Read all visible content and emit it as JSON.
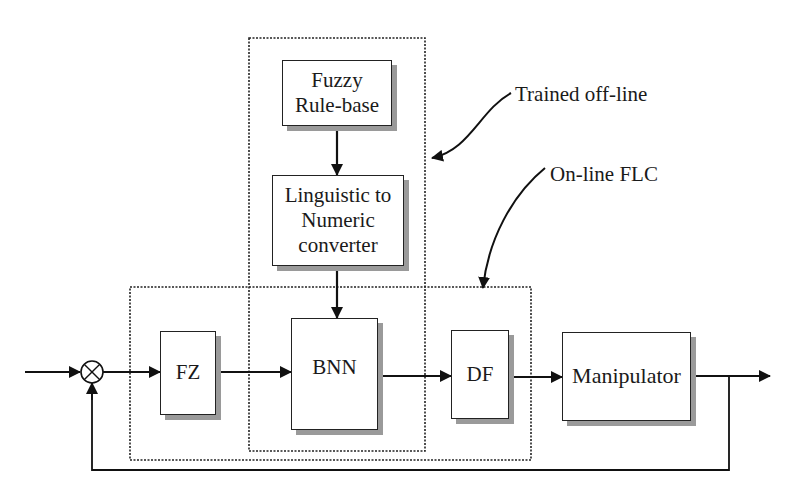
{
  "diagram": {
    "type": "block-diagram",
    "title": "",
    "blocks": {
      "fuzzy_rule_base": {
        "line1": "Fuzzy",
        "line2": "Rule-base"
      },
      "linguistic_converter": {
        "line1": "Linguistic to",
        "line2": "Numeric",
        "line3": "converter"
      },
      "fz": {
        "label": "FZ"
      },
      "bnn": {
        "label": "BNN"
      },
      "df": {
        "label": "DF"
      },
      "manipulator": {
        "label": "Manipulator"
      }
    },
    "summing_junction": {
      "symbol": "multiply-cross-circle"
    },
    "annotations": {
      "trained_offline": "Trained off-line",
      "online_flc": "On-line FLC"
    },
    "groups": [
      {
        "name": "Trained off-line",
        "members": [
          "Fuzzy Rule-base",
          "Linguistic to Numeric converter",
          "BNN"
        ],
        "style": "dotted"
      },
      {
        "name": "On-line FLC",
        "members": [
          "FZ",
          "BNN",
          "DF"
        ],
        "style": "dotted"
      }
    ],
    "connections": [
      {
        "from": "input",
        "to": "summing_junction"
      },
      {
        "from": "summing_junction",
        "to": "FZ"
      },
      {
        "from": "FZ",
        "to": "BNN"
      },
      {
        "from": "Fuzzy Rule-base",
        "to": "Linguistic to Numeric converter"
      },
      {
        "from": "Linguistic to Numeric converter",
        "to": "BNN"
      },
      {
        "from": "BNN",
        "to": "DF"
      },
      {
        "from": "DF",
        "to": "Manipulator"
      },
      {
        "from": "Manipulator",
        "to": "output"
      },
      {
        "from": "output",
        "to": "summing_junction",
        "type": "feedback"
      }
    ],
    "colors": {
      "line": "#111111",
      "shadow": "#9a9a9a",
      "background": "#ffffff"
    }
  }
}
